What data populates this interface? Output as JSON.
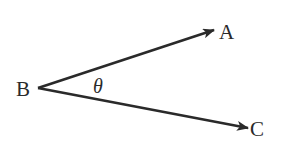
{
  "diagram": {
    "type": "angle-between-vectors",
    "vertex": {
      "label": "B",
      "x": 38,
      "y": 88
    },
    "rays": [
      {
        "label": "A",
        "from": "B",
        "to_x": 214,
        "to_y": 30
      },
      {
        "label": "C",
        "from": "B",
        "to_x": 248,
        "to_y": 128
      }
    ],
    "angle_label": "θ",
    "colors": {
      "line": "#2a2a2a",
      "text": "#2a2a2a",
      "background": "#ffffff"
    }
  },
  "labels": {
    "a": "A",
    "b": "B",
    "c": "C",
    "theta": "θ"
  }
}
